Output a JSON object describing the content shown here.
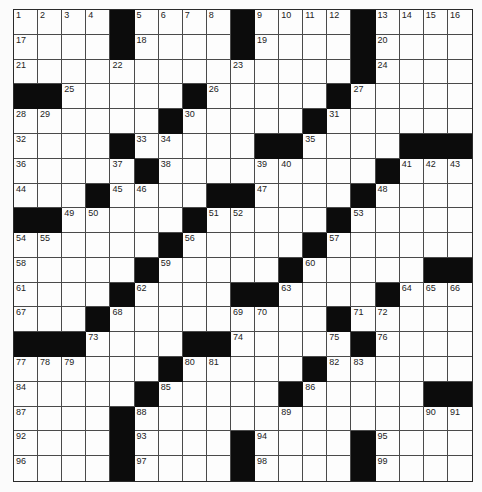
{
  "puzzle": {
    "rows": 19,
    "cols": 19,
    "colors": {
      "block": "#0c0c0c",
      "cell": "#fdfdfd",
      "line": "#4a4a4a",
      "number": "#222222"
    },
    "grid": [
      [
        "1",
        "2",
        "3",
        "4",
        "#",
        "5",
        "6",
        "7",
        "8",
        "#",
        "9",
        "10",
        "11",
        "12",
        "#",
        "13",
        "14",
        "15",
        "16"
      ],
      [
        "17",
        "",
        "",
        "",
        "#",
        "18",
        "",
        "",
        "",
        "#",
        "19",
        "",
        "",
        "",
        "#",
        "20",
        "",
        "",
        ""
      ],
      [
        "21",
        "",
        "",
        "",
        "22",
        "",
        "",
        "",
        "",
        "23",
        "",
        "",
        "",
        "",
        "#",
        "24",
        "",
        "",
        ""
      ],
      [
        "#",
        "#",
        "25",
        "",
        "",
        "",
        "",
        "#",
        "26",
        "",
        "",
        "",
        "",
        "#",
        "27",
        "",
        "",
        "",
        ""
      ],
      [
        "28",
        "29",
        "",
        "",
        "",
        "",
        "#",
        "30",
        "",
        "",
        "",
        "",
        "#",
        "31",
        "",
        "",
        "",
        "",
        ""
      ],
      [
        "32",
        "",
        "",
        "",
        "#",
        "33",
        "34",
        "",
        "",
        "",
        "#",
        "#",
        "35",
        "",
        "",
        "",
        "#",
        "#",
        "#"
      ],
      [
        "36",
        "",
        "",
        "",
        "37",
        "#",
        "38",
        "",
        "",
        "",
        "39",
        "40",
        "",
        "",
        "",
        "#",
        "41",
        "42",
        "43"
      ],
      [
        "44",
        "",
        "",
        "#",
        "45",
        "46",
        "",
        "",
        "#",
        "#",
        "47",
        "",
        "",
        "",
        "#",
        "48",
        "",
        "",
        ""
      ],
      [
        "#",
        "#",
        "49",
        "50",
        "",
        "",
        "",
        "#",
        "51",
        "52",
        "",
        "",
        "",
        "#",
        "53",
        "",
        "",
        "",
        ""
      ],
      [
        "54",
        "55",
        "",
        "",
        "",
        "",
        "#",
        "56",
        "",
        "",
        "",
        "",
        "#",
        "57",
        "",
        "",
        "",
        "",
        ""
      ],
      [
        "58",
        "",
        "",
        "",
        "",
        "#",
        "59",
        "",
        "",
        "",
        "",
        "#",
        "60",
        "",
        "",
        "",
        "",
        "#",
        "#"
      ],
      [
        "61",
        "",
        "",
        "",
        "#",
        "62",
        "",
        "",
        "",
        "#",
        "#",
        "63",
        "",
        "",
        "",
        "#",
        "64",
        "65",
        "66"
      ],
      [
        "67",
        "",
        "",
        "#",
        "68",
        "",
        "",
        "",
        "",
        "69",
        "70",
        "",
        "",
        "#",
        "71",
        "72",
        "",
        "",
        ""
      ],
      [
        "#",
        "#",
        "#",
        "73",
        "",
        "",
        "",
        "#",
        "#",
        "74",
        "",
        "",
        "",
        "75",
        "#",
        "76",
        "",
        "",
        ""
      ],
      [
        "77",
        "78",
        "79",
        "",
        "",
        "",
        "#",
        "80",
        "81",
        "",
        "",
        "",
        "#",
        "82",
        "83",
        "",
        "",
        "",
        ""
      ],
      [
        "84",
        "",
        "",
        "",
        "",
        "#",
        "85",
        "",
        "",
        "",
        "",
        "#",
        "86",
        "",
        "",
        "",
        "",
        "#",
        "#"
      ],
      [
        "87",
        "",
        "",
        "",
        "#",
        "88",
        "",
        "",
        "",
        "",
        "",
        "89",
        "",
        "",
        "",
        "",
        "",
        "90",
        "91"
      ],
      [
        "92",
        "",
        "",
        "",
        "#",
        "93",
        "",
        "",
        "",
        "#",
        "94",
        "",
        "",
        "",
        "#",
        "95",
        "",
        "",
        ""
      ],
      [
        "96",
        "",
        "",
        "",
        "#",
        "97",
        "",
        "",
        "",
        "#",
        "98",
        "",
        "",
        "",
        "#",
        "99",
        "",
        "",
        ""
      ]
    ]
  }
}
